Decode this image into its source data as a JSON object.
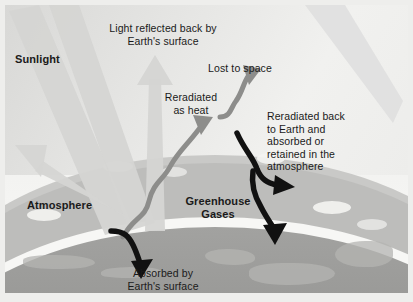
{
  "figure": {
    "width": 413,
    "height": 302,
    "colors": {
      "sky": "#e9e9e7",
      "atmosphere": "#c9c9c7",
      "earth": "#9a9a98",
      "limb": "#f7f7f5",
      "gray_arrow": "#8d8d8b",
      "dark_arrow": "#111111",
      "text": "#1a1a1a",
      "mat": "#eeeeec"
    }
  },
  "labels": {
    "sunlight": "Sunlight",
    "light_reflected": "Light reflected back by\nEarth's surface",
    "lost_to_space": "Lost to space",
    "reradiated_as_heat": "Reradiated\nas heat",
    "reradiated_back": "Reradiated back\nto Earth and\nabsorbed or\nretained in the\natmosphere",
    "atmosphere": "Atmosphere",
    "greenhouse_gases": "Greenhouse\nGases",
    "absorbed_by": "Absorbed by\nEarth's surface"
  },
  "arrows": [
    {
      "name": "sunlight-beam-1",
      "style": "wide-gray-beam",
      "direction": "down-right",
      "from": "upper-left",
      "to": "earth-surface"
    },
    {
      "name": "sunlight-beam-2",
      "style": "wide-gray-beam",
      "direction": "down-right",
      "from": "upper-left",
      "to": "earth-surface"
    },
    {
      "name": "reflected-light-up",
      "style": "wide-gray-arrow",
      "direction": "up",
      "label": "Light reflected back by Earth's surface"
    },
    {
      "name": "reflected-light-up-left",
      "style": "wide-gray-arrow",
      "direction": "up-left"
    },
    {
      "name": "reradiated-as-heat",
      "style": "wavy-gray-arrow",
      "direction": "up-right",
      "label": "Reradiated as heat"
    },
    {
      "name": "lost-to-space",
      "style": "wavy-gray-arrow",
      "direction": "up-right",
      "label": "Lost to space"
    },
    {
      "name": "absorbed-by-surface",
      "style": "curved-dark-arrow",
      "direction": "down",
      "label": "Absorbed by Earth's surface"
    },
    {
      "name": "reradiated-back-up",
      "style": "curved-dark-arrow",
      "direction": "up-right",
      "label": "Reradiated back to Earth"
    },
    {
      "name": "reradiated-back-down",
      "style": "curved-dark-arrow",
      "direction": "down-right",
      "label": "Back to Earth"
    }
  ]
}
